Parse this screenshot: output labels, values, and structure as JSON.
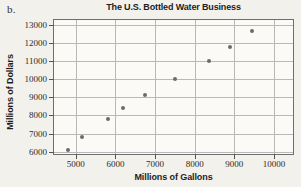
{
  "figure": {
    "part_label": "b.",
    "background_color": "#f3f1ec",
    "plot_background_color": "#fbfaf7",
    "axis_color": "#6e6e6e",
    "grid_color": "#b9b9b9",
    "marker_color": "#6b6b6b"
  },
  "chart_data": {
    "type": "scatter",
    "title": "The U.S. Bottled Water Business",
    "xlabel": "Millions of Gallons",
    "ylabel": "Millions of Dollars",
    "xlim": [
      4450,
      10480
    ],
    "ylim": [
      5870,
      13260
    ],
    "xticks": [
      5000,
      6000,
      7000,
      8000,
      9000,
      10000
    ],
    "yticks": [
      6000,
      7000,
      8000,
      9000,
      10000,
      11000,
      12000,
      13000
    ],
    "xticklabels": [
      "5000",
      "6000",
      "7000",
      "8000",
      "9000",
      "10000"
    ],
    "yticklabels": [
      "6000",
      "7000",
      "8000",
      "9000",
      "10000",
      "11000",
      "12000",
      "13000"
    ],
    "grid": true,
    "legend": null,
    "x": [
      4800,
      5150,
      5800,
      6200,
      6750,
      7500,
      8350,
      8900,
      9450
    ],
    "y": [
      6100,
      6800,
      7800,
      8400,
      9150,
      10000,
      11000,
      11750,
      12650
    ],
    "points": [
      {
        "x": 4800,
        "y": 6100
      },
      {
        "x": 5150,
        "y": 6800
      },
      {
        "x": 5800,
        "y": 7800
      },
      {
        "x": 6200,
        "y": 8400
      },
      {
        "x": 6750,
        "y": 9150
      },
      {
        "x": 7500,
        "y": 10000
      },
      {
        "x": 8350,
        "y": 11000
      },
      {
        "x": 8900,
        "y": 11750
      },
      {
        "x": 9450,
        "y": 12650
      }
    ]
  }
}
